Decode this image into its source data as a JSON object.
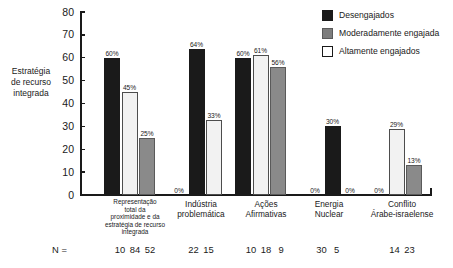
{
  "chart_data": {
    "type": "bar",
    "title": "",
    "xlabel": "",
    "ylabel": "Estratégia de recurso integrada",
    "ylabel_lines": [
      "Estratégia",
      "de recurso",
      "integrada"
    ],
    "ylim": [
      0,
      80
    ],
    "ytick_labels": [
      "80",
      "70",
      "60",
      "50",
      "40",
      "30",
      "20",
      "10",
      "0"
    ],
    "ytick_values": [
      80,
      70,
      60,
      50,
      40,
      30,
      20,
      10,
      0
    ],
    "grid": false,
    "legend_position": "top-right",
    "categories": [
      "Representação total da proximidade e da estratégia de recurso integrada",
      "Indústria problemática",
      "Ações Afirmativas",
      "Energia Nuclear",
      "Conflito Árabe-israelense"
    ],
    "category_label_lines": [
      [
        "Representação",
        "total da",
        "proximidade e da",
        "estratégia de recurso",
        "integrada"
      ],
      [
        "Indústria",
        "problemática"
      ],
      [
        "Ações",
        "Afirmativas"
      ],
      [
        "Energia",
        "Nuclear"
      ],
      [
        "Conflito",
        "Árabe-israelense"
      ]
    ],
    "series": [
      {
        "name": "Desengajados",
        "color": "#1a1a1a",
        "values": [
          60,
          64,
          60,
          30,
          0
        ],
        "labels": [
          "60%",
          "64%",
          "60%",
          "30%",
          "0%"
        ]
      },
      {
        "name": "Moderadamente engajada",
        "color": "#8a8a8a",
        "values": [
          25,
          0,
          56,
          0,
          13
        ],
        "labels": [
          "25%",
          "0%",
          "56%",
          "0%",
          "13%"
        ]
      },
      {
        "name": "Altamente engajados",
        "color": "#f2f2f2",
        "values": [
          45,
          33,
          61,
          0,
          29
        ],
        "labels": [
          "45%",
          "33%",
          "61%",
          "",
          "29%"
        ]
      }
    ],
    "bars": [
      {
        "group": 0,
        "slot": 0,
        "series": "Desengajados",
        "style": "black",
        "value": 60,
        "label": "60%"
      },
      {
        "group": 0,
        "slot": 1,
        "series": "Altamente engajados",
        "style": "white",
        "value": 45,
        "label": "45%"
      },
      {
        "group": 0,
        "slot": 2,
        "series": "Moderadamente engajada",
        "style": "gray",
        "value": 25,
        "label": "25%"
      },
      {
        "group": 1,
        "slot": 0,
        "series": "Moderadamente engajada",
        "style": "none",
        "value": 0,
        "label": "0%"
      },
      {
        "group": 1,
        "slot": 1,
        "series": "Desengajados",
        "style": "black",
        "value": 64,
        "label": "64%"
      },
      {
        "group": 1,
        "slot": 2,
        "series": "Altamente engajados",
        "style": "white",
        "value": 33,
        "label": "33%"
      },
      {
        "group": 2,
        "slot": 0,
        "series": "Desengajados",
        "style": "black",
        "value": 60,
        "label": "60%"
      },
      {
        "group": 2,
        "slot": 1,
        "series": "Altamente engajados",
        "style": "white",
        "value": 61,
        "label": "61%"
      },
      {
        "group": 2,
        "slot": 2,
        "series": "Moderadamente engajada",
        "style": "gray",
        "value": 56,
        "label": "56%"
      },
      {
        "group": 3,
        "slot": 0,
        "series": "Altamente engajados",
        "style": "none",
        "value": 0,
        "label": "0%"
      },
      {
        "group": 3,
        "slot": 1,
        "series": "Desengajados",
        "style": "black",
        "value": 30,
        "label": "30%"
      },
      {
        "group": 3,
        "slot": 2,
        "series": "Moderadamente engajada",
        "style": "none",
        "value": 0,
        "label": "0%"
      },
      {
        "group": 4,
        "slot": 0,
        "series": "Desengajados",
        "style": "none",
        "value": 0,
        "label": "0%"
      },
      {
        "group": 4,
        "slot": 1,
        "series": "Altamente engajados",
        "style": "white",
        "value": 29,
        "label": "29%"
      },
      {
        "group": 4,
        "slot": 2,
        "series": "Moderadamente engajada",
        "style": "gray",
        "value": 13,
        "label": "13%"
      }
    ],
    "n_prefix": "N =",
    "n_values": [
      [
        "10",
        "84",
        "52"
      ],
      [
        "22",
        "15"
      ],
      [
        "10",
        "18",
        "9"
      ],
      [
        "30",
        "5"
      ],
      [
        "14",
        "23"
      ]
    ]
  },
  "legend": {
    "items": [
      {
        "label": "Desengajados",
        "style": "black"
      },
      {
        "label": "Moderadamente engajada",
        "style": "gray"
      },
      {
        "label": "Altamente engajados",
        "style": "white"
      }
    ]
  },
  "colors": {
    "black_series": "#1a1a1a",
    "gray_series": "#8a8a8a",
    "white_series": "#f2f2f2",
    "axis": "#1a1a1a",
    "background": "#ffffff"
  }
}
